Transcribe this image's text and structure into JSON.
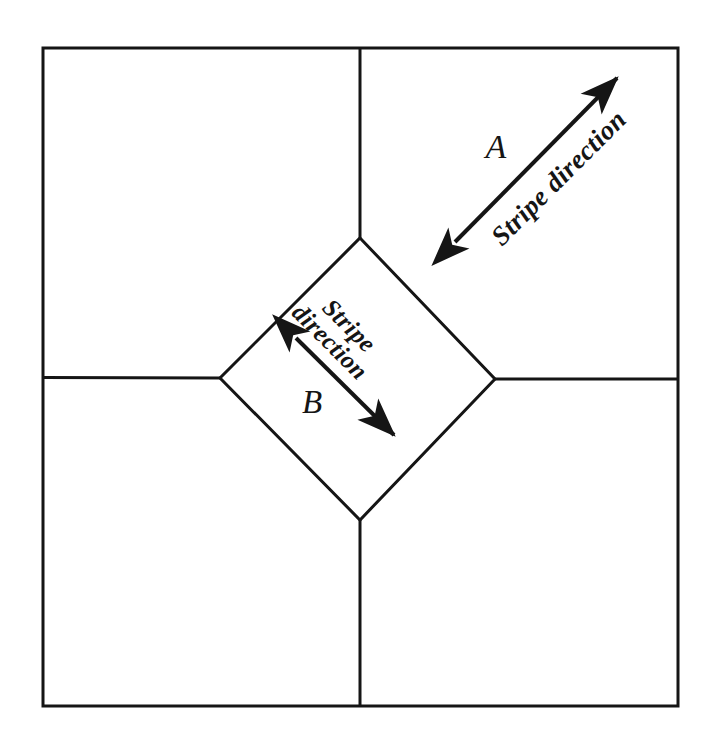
{
  "figure": {
    "type": "diagram",
    "background_color": "#ffffff",
    "line_color": "#151515",
    "frame": {
      "x": 43,
      "y": 48,
      "width": 635,
      "height": 658,
      "stroke_width": 3
    },
    "central_tile": {
      "shape": "diamond",
      "top": [
        360,
        238
      ],
      "left": [
        220,
        378
      ],
      "right": [
        495,
        379
      ],
      "bottom": [
        360,
        520
      ]
    },
    "joint_lines": [
      {
        "name": "top-joint",
        "from": [
          360,
          48
        ],
        "to": [
          360,
          238
        ]
      },
      {
        "name": "left-joint",
        "from": [
          43,
          377
        ],
        "to": [
          220,
          378
        ]
      },
      {
        "name": "right-joint",
        "from": [
          495,
          379
        ],
        "to": [
          678,
          379
        ]
      },
      {
        "name": "bottom-joint",
        "from": [
          360,
          520
        ],
        "to": [
          360,
          706
        ]
      }
    ],
    "annotations": [
      {
        "id": "A",
        "region_label": "A",
        "region_label_position": [
          496,
          158
        ],
        "stripe_text": "Stripe direction",
        "stripe_text_anchor": [
          502,
          247
        ],
        "stripe_text_rotation_deg": -45,
        "stripe_text_size": 27,
        "region_label_size": 34,
        "arrow": {
          "from": [
            452,
            245
          ],
          "to": [
            620,
            75
          ],
          "double_headed": true,
          "stroke_width": 4,
          "angle_deg": -45.3
        }
      },
      {
        "id": "B",
        "region_label": "B",
        "region_label_position": [
          312,
          413
        ],
        "stripe_text_line1": "Stripe",
        "stripe_text_line2": "direction",
        "stripe_text_anchor": [
          321,
          309
        ],
        "stripe_text_rotation_deg": 45,
        "stripe_text_size": 25,
        "region_label_size": 33,
        "arrow": {
          "from": [
            293,
            335
          ],
          "to": [
            397,
            438
          ],
          "double_headed": true,
          "stroke_width": 4,
          "angle_deg": 44.7
        }
      }
    ]
  }
}
